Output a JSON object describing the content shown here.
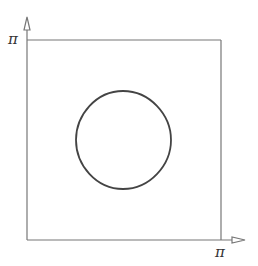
{
  "diagram": {
    "y_axis_label": "π",
    "x_axis_label": "π",
    "colors": {
      "axes": "#777777",
      "curve": "#444444",
      "background": "#ffffff"
    },
    "domain": {
      "x": [
        0,
        "π"
      ],
      "y": [
        0,
        "π"
      ]
    },
    "curve": {
      "shape": "closed rounded-square level curve",
      "center": [
        "π/2",
        "π/2"
      ]
    }
  }
}
